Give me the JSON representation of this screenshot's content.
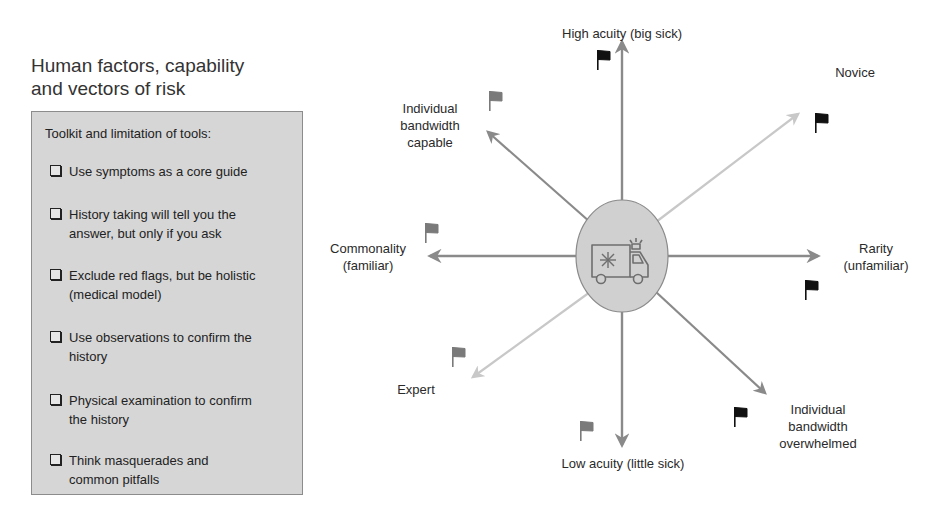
{
  "title": {
    "line1": "Human factors, capability",
    "line2": "and vectors of risk"
  },
  "toolbox": {
    "heading": "Toolkit and limitation of tools:",
    "items": [
      {
        "line1": "Use symptoms as a core guide",
        "line2": ""
      },
      {
        "line1": "History taking will tell you the",
        "line2": "answer, but only if you ask"
      },
      {
        "line1": "Exclude red flags, but be holistic",
        "line2": "(medical model)"
      },
      {
        "line1": "Use observations to confirm the",
        "line2": "history"
      },
      {
        "line1": "Physical examination to confirm",
        "line2": "the history"
      },
      {
        "line1": "Think masquerades and",
        "line2": "common pitfalls"
      }
    ]
  },
  "diagram": {
    "center_icon": "ambulance-icon",
    "axes": {
      "up": {
        "line1": "High acuity (big sick)",
        "flag": "black"
      },
      "down": {
        "line1": "Low acuity (little sick)",
        "flag": "gray"
      },
      "left": {
        "line1": "Commonality",
        "line2": "(familiar)",
        "flag": "gray"
      },
      "right": {
        "line1": "Rarity",
        "line2": "(unfamiliar)",
        "flag": "black"
      },
      "up_left": {
        "line1": "Individual",
        "line2": "bandwidth",
        "line3": "capable",
        "flag": "gray"
      },
      "down_right": {
        "line1": "Individual",
        "line2": "bandwidth",
        "line3": "overwhelmed",
        "flag": "black"
      },
      "up_right": {
        "line1": "Novice",
        "flag": "black"
      },
      "down_left": {
        "line1": "Expert",
        "flag": "gray"
      }
    },
    "colors": {
      "axis_dark": "#8a8a8a",
      "axis_light": "#c8c8c8",
      "flag_black": "#111111",
      "flag_gray": "#7a7a7a",
      "ellipse_fill": "#d0d0d0",
      "box_fill": "#d6d6d6"
    }
  }
}
